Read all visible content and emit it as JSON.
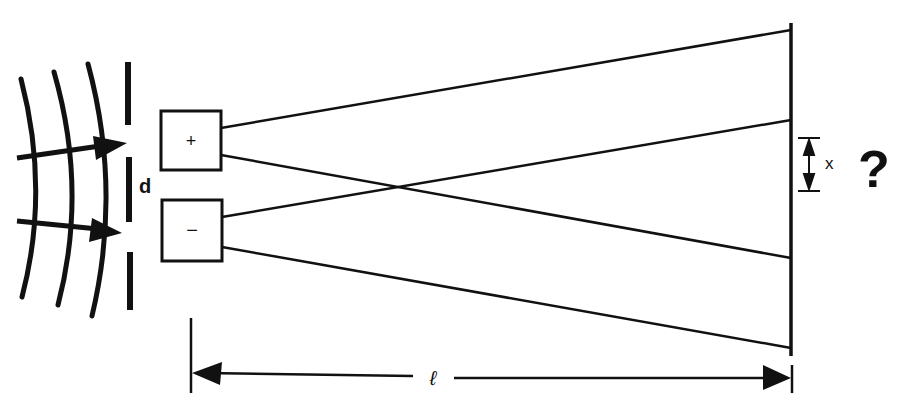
{
  "diagram": {
    "colors": {
      "ink": "#111111",
      "background": "#ffffff"
    },
    "labels": {
      "slit_separation": "d",
      "fringe_spacing": "x",
      "distance_to_screen": "ℓ",
      "question": "?",
      "plus_box": "+",
      "minus_box": "−"
    },
    "elements": {
      "wavefronts": 3,
      "incident_arrows": 2,
      "barrier_segments": 3,
      "source_boxes": [
        "+",
        "−"
      ],
      "rays": 4,
      "screen": 1
    }
  }
}
